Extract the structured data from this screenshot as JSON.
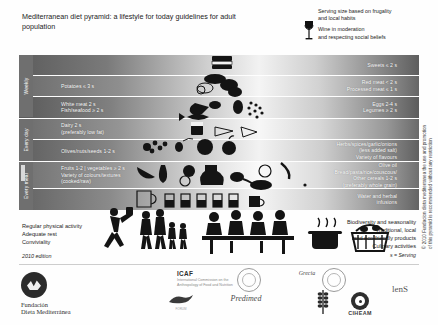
{
  "title": "Mediterranean diet pyramid: a lifestyle for today\nguidelines for adult population",
  "top_note": {
    "serving_note": "Serving size based on frugality\nand local habits",
    "wine_note": "Wine in moderation\nand respecting social beliefs",
    "wine_icon": "wine-glass-icon"
  },
  "frequency_tabs": [
    {
      "label": "Weekly"
    },
    {
      "label": "Every day"
    },
    {
      "label": "Every meal"
    }
  ],
  "bands": [
    {
      "id": "sweets",
      "left": "",
      "right": "Sweets ≤ 2 s"
    },
    {
      "id": "meat",
      "left": "Potatoes ≤ 3 s",
      "right": "Red meat < 2 s\nProcessed meat ≤ 1 s"
    },
    {
      "id": "protein",
      "left": "White meat 2 s\nFish/seafood ≥ 2 s",
      "right": "Eggs 2-4 s\nLegumes ≥ 2 s"
    },
    {
      "id": "dairy",
      "left": "Dairy 2 s\n(preferably low fat)",
      "right": ""
    },
    {
      "id": "olives",
      "left": "Olives/nuts/seeds 1-2 s",
      "right": "Herbs/spices/garlic/onions\n(less added salt)\nVariety of flavours"
    },
    {
      "id": "fruitveg",
      "left": "Fruits 1-2  |  vegetables ≥ 2 s\nVariety of colours/textures\n(cooked/raw)",
      "right": "Olive oil\nBread/pasta/rice/couscous/\nOther cereals 1-2 s\n(preferably whole grain)"
    },
    {
      "id": "water",
      "left": "",
      "right": "Water and herbal\ninfusions"
    }
  ],
  "advice_left": "Regular physical activity\nAdequate rest\nConviviality",
  "advice_right": "Biodiversity and seasonality\nTraditional, local\nand eco-friendly products\nCulinary activities",
  "serving_key": "s = Serving",
  "edition": "2010 edition",
  "copyright": "© 2010 Fundacion dieta mediterranea the use and promotion\nof this pyramid is recommended without any restriction",
  "logos": {
    "foundation_name": "Fundación\nDieta Mediterránea",
    "icaf_acronym": "ICAF",
    "icaf_full": "International Commission on the\nAnthropology of Food and Nutrition",
    "ciheam": "CIHEAM",
    "lens": "lenS",
    "predimed": "Predimed",
    "grecia": "Grecia",
    "forum": "FORUM"
  },
  "colors": {
    "band_edge_dark": "#5d5d5d",
    "band_center_light": "#f5f5f5",
    "tab_gray": "#6f6f6f",
    "text_white": "#ffffff",
    "text_dark": "#1c1c1c"
  }
}
